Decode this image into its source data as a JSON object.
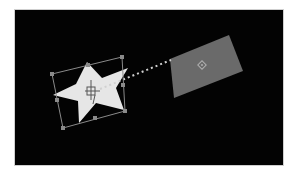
{
  "canvas": {
    "background": "#030303",
    "border": "#cfcfcf"
  },
  "star_layer": {
    "name": "star-shape",
    "fill": "#e6e6e6",
    "selected": true,
    "points": "87,62 102,78 128,68 116,88 124,110 96,103 79,123 78,101 53,95 76,84",
    "bounding_box": {
      "stroke": "#8a8a8a",
      "corners": "52,74 122,57 125,111 63,128",
      "handles": [
        {
          "id": "top-left",
          "x": 52,
          "y": 74
        },
        {
          "id": "top-mid",
          "x": 88,
          "y": 65
        },
        {
          "id": "top-right",
          "x": 122,
          "y": 57
        },
        {
          "id": "right-mid",
          "x": 123,
          "y": 85
        },
        {
          "id": "bottom-right",
          "x": 125,
          "y": 111
        },
        {
          "id": "bottom-mid",
          "x": 95,
          "y": 118
        },
        {
          "id": "bottom-left",
          "x": 63,
          "y": 128
        },
        {
          "id": "left-mid",
          "x": 57,
          "y": 100
        }
      ]
    },
    "anchor": {
      "x": 92,
      "y": 92
    }
  },
  "motion_path": {
    "from": {
      "x": 100,
      "y": 89
    },
    "to": {
      "x": 171,
      "y": 60
    },
    "color": "#d0d0d0"
  },
  "target_layer": {
    "name": "gray-parallelogram",
    "fill": "#6a6a6a",
    "points": "170,59 229,35 243,71 174,98",
    "center": {
      "x": 202,
      "y": 65
    }
  }
}
